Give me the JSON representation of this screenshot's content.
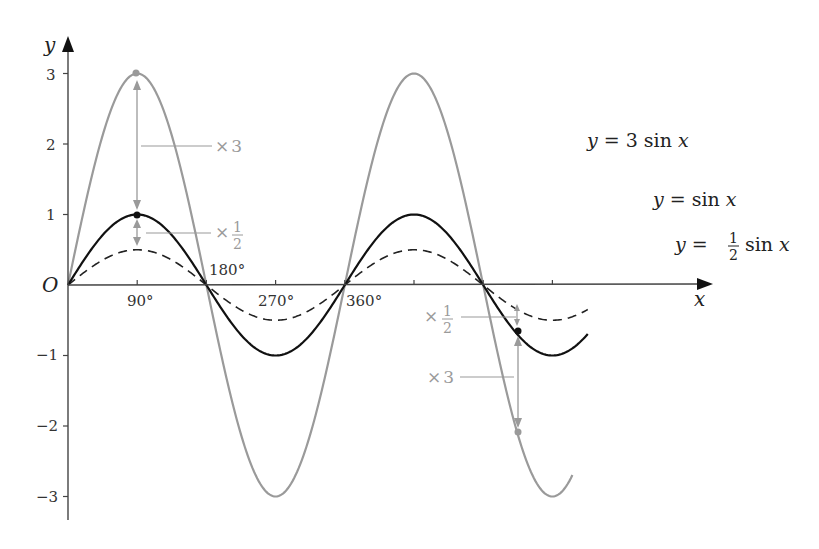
{
  "chart_data": {
    "type": "line",
    "title": "",
    "xlabel": "x",
    "ylabel": "y",
    "origin_label": "O",
    "x_unit": "degrees",
    "xlim": [
      0,
      720
    ],
    "ylim": [
      -3.3,
      3.3
    ],
    "x_ticks": [
      90,
      180,
      270,
      360,
      450,
      540,
      630
    ],
    "x_tick_labels": [
      "90°",
      "180°",
      "270°",
      "360°"
    ],
    "y_ticks": [
      3,
      2,
      1,
      -1,
      -2,
      -3
    ],
    "y_tick_labels": [
      "3",
      "2",
      "1",
      "−1",
      "−2",
      "−3"
    ],
    "grid": false,
    "series": [
      {
        "name": "y = 3 sin x",
        "amplitude": 3,
        "style": "solid",
        "color": "#9a9a9a",
        "x_end": 657
      },
      {
        "name": "y = sin x",
        "amplitude": 1,
        "style": "solid",
        "color": "#111111",
        "x_end": 677
      },
      {
        "name": "y = ½ sin x",
        "amplitude": 0.5,
        "style": "dashed",
        "color": "#222222",
        "x_end": 677
      }
    ],
    "annotations": [
      {
        "x": 90,
        "from_y": 1,
        "to_y": 3,
        "label": "×3"
      },
      {
        "x": 90,
        "from_y": 1,
        "to_y": 0.5,
        "label": "×½"
      },
      {
        "x": 585,
        "from_y": -0.7,
        "to_y": -2.1,
        "label": "×3"
      },
      {
        "x": 585,
        "from_y": -0.7,
        "to_y": -0.35,
        "label": "×½"
      }
    ]
  },
  "labels": {
    "y_axis": "y",
    "x_axis": "x",
    "origin": "O",
    "tick_90": "90°",
    "tick_180": "180°",
    "tick_270": "270°",
    "tick_360": "360°",
    "y3": "3",
    "y2": "2",
    "y1": "1",
    "ym1": "−1",
    "ym2": "−2",
    "ym3": "−3",
    "eq_3sin": "y = 3 sin x",
    "eq_sin": "y = sin x",
    "eq_half_prefix": "y =",
    "eq_half_suffix": "sin x",
    "frac_num": "1",
    "frac_den": "2",
    "times": "×",
    "three": "3"
  },
  "colors": {
    "gray_curve": "#9a9a9a",
    "black_curve": "#111111",
    "axis": "#444444",
    "annotation": "#9a9a9a"
  }
}
